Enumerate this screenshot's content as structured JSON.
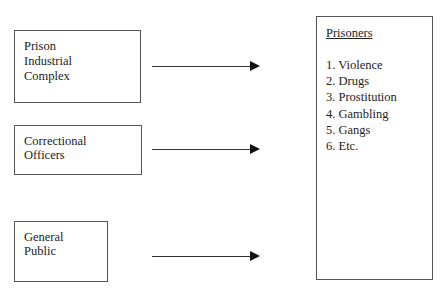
{
  "diagram": {
    "sources": [
      {
        "label": "Prison\nIndustrial\nComplex"
      },
      {
        "label": "Correctional\nOfficers"
      },
      {
        "label": "General\nPublic"
      }
    ],
    "target": {
      "title": "Prisoners",
      "items": [
        "1. Violence",
        "2. Drugs",
        "3. Prostitution",
        "4. Gambling",
        "5. Gangs",
        "6. Etc."
      ]
    },
    "colors": {
      "border": "#555555",
      "arrow": "#333333",
      "text": "#222222"
    }
  }
}
